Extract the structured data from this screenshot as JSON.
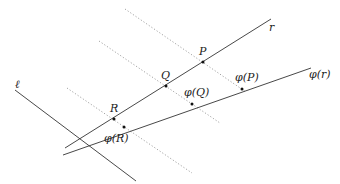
{
  "diagram": {
    "type": "geometry",
    "lines": [
      {
        "id": "r",
        "label": "r",
        "style": "solid",
        "x1": 65,
        "y1": 148,
        "x2": 271,
        "y2": 19,
        "label_x": 269,
        "label_y": 31
      },
      {
        "id": "phi_r",
        "label": "φ(r)",
        "style": "solid",
        "x1": 63,
        "y1": 155,
        "x2": 311,
        "y2": 68,
        "label_x": 309,
        "label_y": 78
      },
      {
        "id": "ell",
        "label": "ℓ",
        "style": "solid",
        "x1": 15,
        "y1": 90,
        "x2": 136,
        "y2": 181,
        "label_x": 15,
        "label_y": 88
      },
      {
        "id": "proj_P",
        "label": "",
        "style": "dotted",
        "x1": 125,
        "y1": 9,
        "x2": 246,
        "y2": 92
      },
      {
        "id": "proj_Q",
        "label": "",
        "style": "dotted",
        "x1": 99,
        "y1": 41,
        "x2": 220,
        "y2": 123
      },
      {
        "id": "proj_R",
        "label": "",
        "style": "dotted",
        "x1": 67,
        "y1": 88,
        "x2": 192,
        "y2": 173
      }
    ],
    "points": [
      {
        "id": "P",
        "label": "P",
        "x": 203,
        "y": 62,
        "label_x": 199,
        "label_y": 55
      },
      {
        "id": "Q",
        "label": "Q",
        "x": 166,
        "y": 86,
        "label_x": 161,
        "label_y": 79
      },
      {
        "id": "R",
        "label": "R",
        "x": 114,
        "y": 119,
        "label_x": 110,
        "label_y": 112
      },
      {
        "id": "phi_P",
        "label": "φ(P)",
        "x": 242,
        "y": 89,
        "label_x": 235,
        "label_y": 81
      },
      {
        "id": "phi_Q",
        "label": "φ(Q)",
        "x": 192,
        "y": 104,
        "label_x": 184,
        "label_y": 96
      },
      {
        "id": "phi_R",
        "label": "φ(R)",
        "x": 124,
        "y": 127,
        "label_x": 104,
        "label_y": 142
      }
    ]
  }
}
